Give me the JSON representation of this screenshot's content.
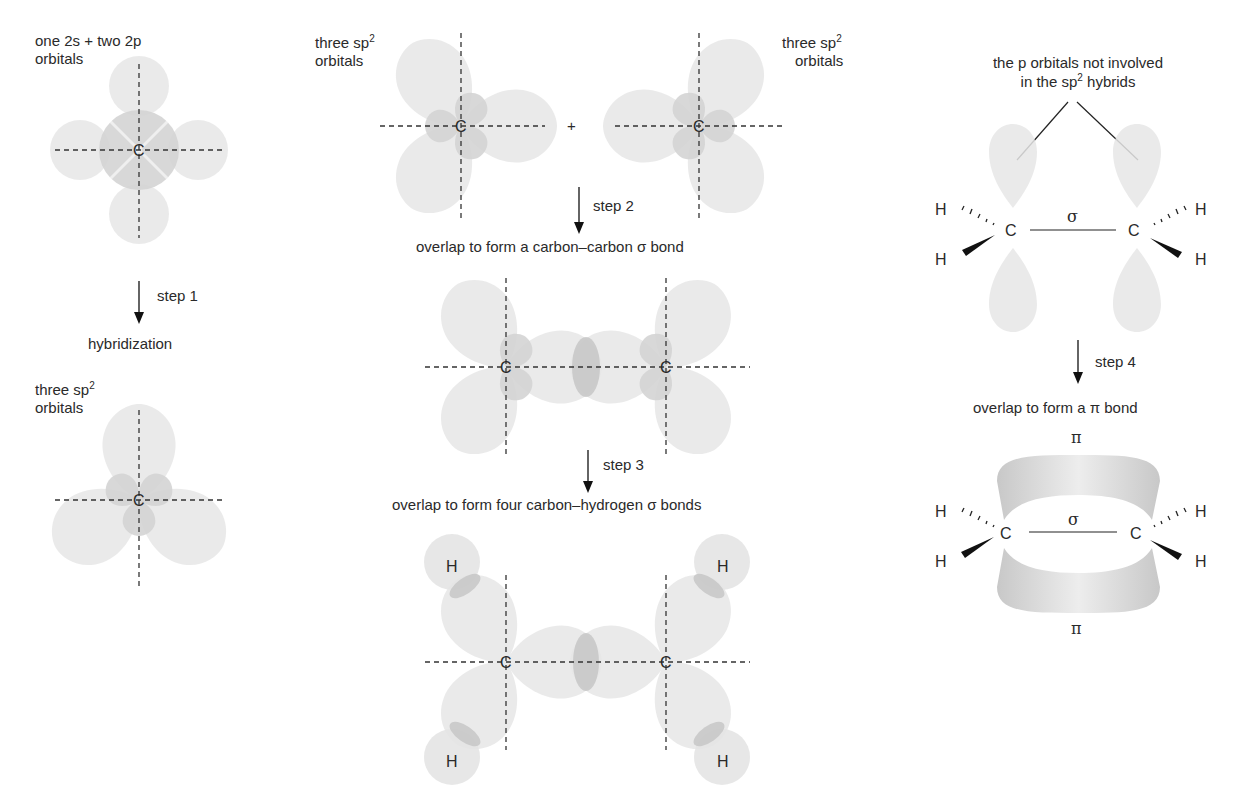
{
  "title_partial": "Figure: formation of the bonds in ethene (cut off at top)",
  "left_panel": {
    "top_label_line1": "one 2s + two 2p",
    "top_label_line2": "orbitals",
    "step1_label": "step 1",
    "hybridization_label": "hybridization",
    "bottom_label_line1": "three sp",
    "bottom_label_sup": "2",
    "bottom_label_line2": "orbitals",
    "carbon": "C"
  },
  "middle_panel": {
    "left_label_line1": "three sp",
    "left_label_sup": "2",
    "left_label_line2": "orbitals",
    "right_label_line1": "three sp",
    "right_label_sup": "2",
    "right_label_line2": "orbitals",
    "plus": "+",
    "step2_label": "step 2",
    "step2_caption": "overlap to form a carbon–carbon σ bond",
    "step3_label": "step 3",
    "step3_caption": "overlap to form four carbon–hydrogen σ bonds",
    "carbon": "C",
    "hydrogen": "H"
  },
  "right_panel": {
    "p_label_line1": "the p orbitals not involved",
    "p_label_line2_a": "in the sp",
    "p_label_sup": "2",
    "p_label_line2_b": " hybrids",
    "sigma": "σ",
    "pi": "π",
    "carbon": "C",
    "hydrogen": "H",
    "step4_label": "step 4",
    "step4_caption": "overlap to form a π bond"
  },
  "colors": {
    "lobe_light": "#e6e6e6",
    "lobe_medium": "#d4d4d4",
    "overlap": "#c4c4c4",
    "ink": "#2a2a2a"
  }
}
